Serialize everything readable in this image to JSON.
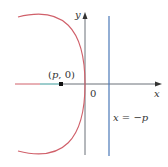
{
  "diagram": {
    "axes": {
      "x_label": "x",
      "y_label": "y",
      "origin_label": "0",
      "axis_color": "#6b7079"
    },
    "parabola": {
      "equation": "y^2 = 4px (p < 0)",
      "color": "#d0606a"
    },
    "focus": {
      "label_open": "(",
      "label_p": "p",
      "label_rest": ", 0)",
      "color": "#111111"
    },
    "directrix": {
      "label_x": "x",
      "label_eq": " = −",
      "label_p": "p",
      "color": "#4a78b8"
    },
    "focus_segment_color": "#3a9a9a"
  }
}
